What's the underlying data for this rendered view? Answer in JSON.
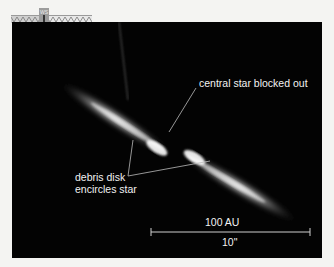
{
  "header_strip": {
    "compass_label": "WS",
    "north_marker": "N",
    "icon": "compass-arrow-icon"
  },
  "annotations": {
    "central_star": "central star blocked out",
    "debris_disk_line1": "debris disk",
    "debris_disk_line2": "encircles star"
  },
  "scale_bar": {
    "physical_label": "100 AU",
    "angular_label": "10\""
  },
  "colors": {
    "background": "#030303",
    "text": "#f2f2f2",
    "disk": "#ffffff"
  }
}
